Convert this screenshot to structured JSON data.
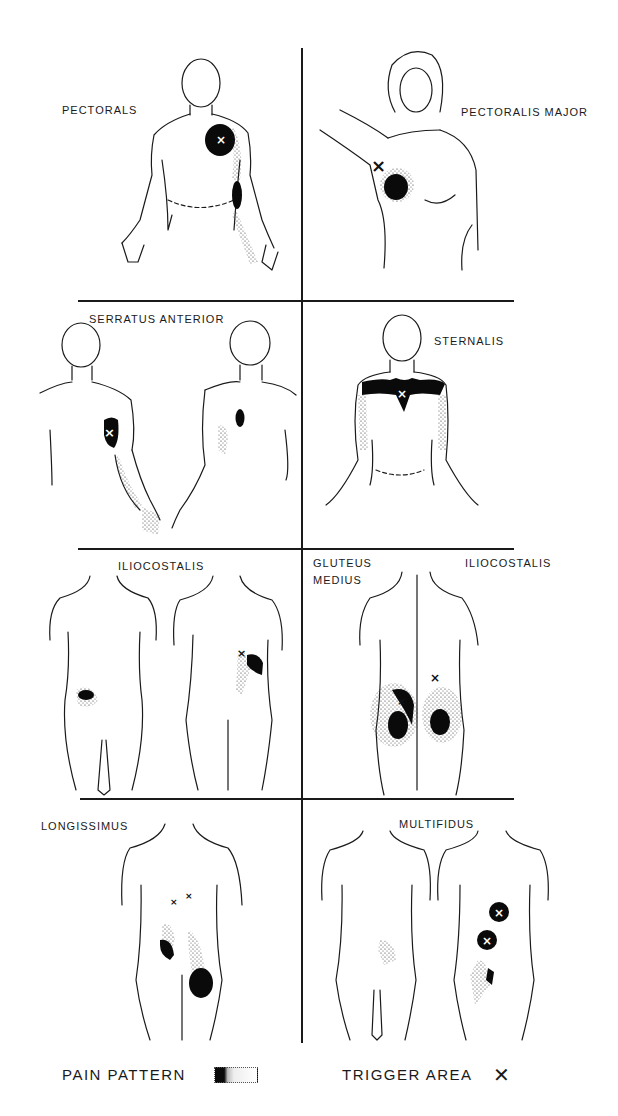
{
  "figure": {
    "panels": [
      {
        "id": "pectorals",
        "label": "PECTORALS",
        "view": "front, male torso"
      },
      {
        "id": "pectoralis-major",
        "label": "PECTORALIS MAJOR",
        "view": "front, female torso, arm raised"
      },
      {
        "id": "serratus-anterior",
        "label": "SERRATUS ANTERIOR",
        "view": "front and back"
      },
      {
        "id": "sternalis",
        "label": "STERNALIS",
        "view": "front"
      },
      {
        "id": "iliocostalis-left",
        "label": "ILIOCOSTALIS",
        "view": "front and back"
      },
      {
        "id": "gluteus-iliocostalis",
        "labels": [
          "GLUTEUS\nMEDIUS",
          "ILIOCOSTALIS"
        ],
        "view": "back"
      },
      {
        "id": "longissimus",
        "label": "LONGISSIMUS",
        "view": "back"
      },
      {
        "id": "multifidus",
        "label": "MULTIFIDUS",
        "view": "front and back"
      }
    ]
  },
  "legend": {
    "pain_pattern_label": "PAIN PATTERN",
    "trigger_area_label": "TRIGGER AREA",
    "trigger_symbol": "✕"
  },
  "colors": {
    "ink": "#1a1a1a",
    "background": "#ffffff"
  }
}
